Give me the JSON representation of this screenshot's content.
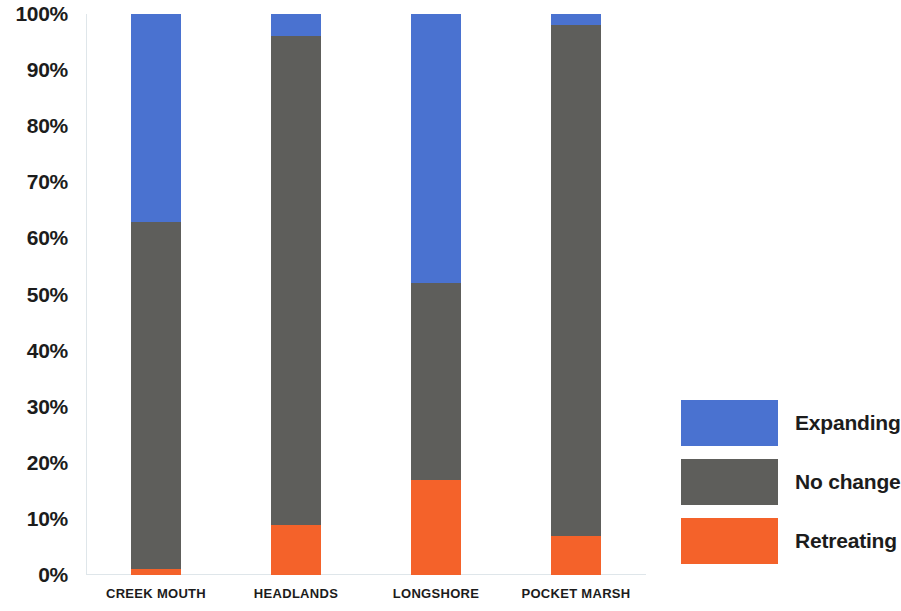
{
  "chart_data": {
    "type": "bar",
    "subtype": "stacked-bar-100-percent",
    "title": "",
    "subtitle": "",
    "xlabel": "",
    "ylabel": "",
    "ylim": [
      0,
      100
    ],
    "y_tick_labels": [
      "100%",
      "90%",
      "80%",
      "70%",
      "60%",
      "50%",
      "40%",
      "30%",
      "20%",
      "10%",
      "0%"
    ],
    "y_tick_values": [
      100,
      90,
      80,
      70,
      60,
      50,
      40,
      30,
      20,
      10,
      0
    ],
    "grid": false,
    "legend_position": "right",
    "categories": [
      "CREEK MOUTH",
      "HEADLANDS",
      "LONGSHORE",
      "POCKET MARSH"
    ],
    "series": [
      {
        "name": "Expanding",
        "color": "#4a72d0",
        "values": [
          37,
          4,
          48,
          2
        ]
      },
      {
        "name": "No change",
        "color": "#5e5e5b",
        "values": [
          62,
          87,
          35,
          91
        ]
      },
      {
        "name": "Retreating",
        "color": "#f4622a",
        "values": [
          1,
          9,
          17,
          7
        ]
      }
    ],
    "stack_order_bottom_to_top": [
      "Retreating",
      "No change",
      "Expanding"
    ],
    "cumulative_tops": {
      "Retreating": [
        1,
        9,
        17,
        7
      ],
      "No change": [
        63,
        96,
        52,
        98
      ],
      "Expanding": [
        100,
        100,
        100,
        100
      ]
    }
  },
  "legend": {
    "items": [
      {
        "label": "Expanding",
        "color": "#4a72d0"
      },
      {
        "label": "No change",
        "color": "#5e5e5b"
      },
      {
        "label": "Retreating",
        "color": "#f4622a"
      }
    ]
  },
  "colors": {
    "expanding": "#4a72d0",
    "no_change": "#5e5e5b",
    "retreating": "#f4622a",
    "axis_line": "#dfe6ea",
    "text": "#1c1c1c",
    "background": "#ffffff"
  }
}
